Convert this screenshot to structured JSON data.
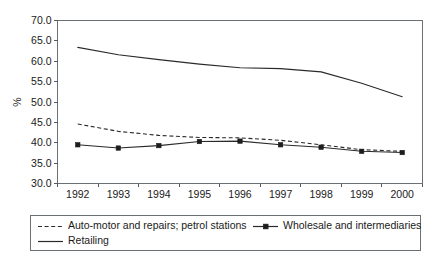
{
  "chart_data": {
    "type": "line",
    "title": "",
    "subtitle": "",
    "xlabel": "",
    "ylabel": "%",
    "categories": [
      "1992",
      "1993",
      "1994",
      "1995",
      "1996",
      "1997",
      "1998",
      "1999",
      "2000"
    ],
    "x": [
      1992,
      1993,
      1994,
      1995,
      1996,
      1997,
      1998,
      1999,
      2000
    ],
    "ylim": [
      30.0,
      70.0
    ],
    "yticks": [
      "30.0",
      "35.0",
      "40.0",
      "45.0",
      "50.0",
      "55.0",
      "60.0",
      "65.0",
      "70.0"
    ],
    "ytick_values": [
      30.0,
      35.0,
      40.0,
      45.0,
      50.0,
      55.0,
      60.0,
      65.0,
      70.0
    ],
    "grid": false,
    "legend_position": "bottom",
    "series": [
      {
        "name": "Auto-motor and repairs; petrol stations",
        "style": "dashed",
        "marker": "none",
        "values": [
          44.6,
          42.8,
          41.8,
          41.3,
          41.2,
          40.6,
          39.5,
          38.3,
          37.9
        ]
      },
      {
        "name": "Wholesale and intermediaries",
        "style": "solid",
        "marker": "square",
        "values": [
          39.5,
          38.7,
          39.3,
          40.3,
          40.4,
          39.5,
          38.9,
          37.9,
          37.6
        ]
      },
      {
        "name": "Retailing",
        "style": "solid",
        "marker": "none",
        "values": [
          63.4,
          61.6,
          60.4,
          59.3,
          58.4,
          58.2,
          57.4,
          54.6,
          51.3
        ]
      }
    ]
  },
  "legend": {
    "entries": [
      {
        "label": "Auto-motor and repairs; petrol stations",
        "swatch": "dashed-line-swatch"
      },
      {
        "label": "Wholesale and intermediaries",
        "swatch": "solid-line-square-marker-swatch"
      },
      {
        "label": "Retailing",
        "swatch": "solid-line-swatch"
      }
    ]
  }
}
